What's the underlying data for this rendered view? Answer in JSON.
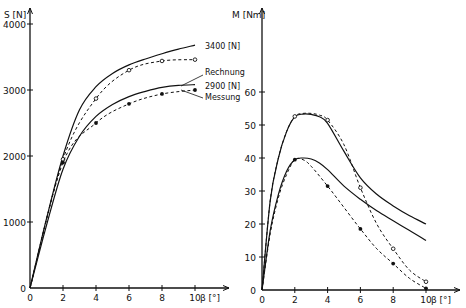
{
  "chart_data": [
    {
      "type": "line",
      "title": "",
      "ylabel": "S [N]",
      "xlabel": "β [°]",
      "xlim": [
        0,
        10
      ],
      "ylim": [
        0,
        4000
      ],
      "xticks": [
        0,
        2,
        4,
        6,
        8,
        10
      ],
      "yticks": [
        0,
        1000,
        2000,
        3000,
        4000
      ],
      "grid": false,
      "annotations": [
        "3400 [N]",
        "Rechnung",
        "2900 [N]",
        "Messung"
      ],
      "series": [
        {
          "name": "Rechnung 3400 [N]",
          "style": "solid",
          "x": [
            0,
            1,
            2,
            3,
            4,
            5,
            6,
            7,
            8,
            9,
            10
          ],
          "y": [
            0,
            1050,
            2000,
            2700,
            3050,
            3250,
            3380,
            3470,
            3550,
            3620,
            3680
          ]
        },
        {
          "name": "Messung 3400 [N]",
          "style": "dashed",
          "marker": "open-circle",
          "x": [
            0,
            2,
            4,
            6,
            8,
            10
          ],
          "y": [
            0,
            1950,
            2870,
            3300,
            3440,
            3460
          ]
        },
        {
          "name": "Rechnung 2900 [N]",
          "style": "solid",
          "x": [
            0,
            1,
            2,
            3,
            4,
            5,
            6,
            7,
            8,
            9,
            10
          ],
          "y": [
            0,
            950,
            1800,
            2300,
            2600,
            2780,
            2900,
            2980,
            3040,
            3070,
            3080
          ]
        },
        {
          "name": "Messung 2900 [N]",
          "style": "dashed",
          "marker": "filled-circle",
          "x": [
            0,
            2,
            4,
            6,
            8,
            10
          ],
          "y": [
            0,
            1900,
            2500,
            2790,
            2940,
            3000
          ]
        }
      ]
    },
    {
      "type": "line",
      "title": "",
      "ylabel": "M [Nm]",
      "xlabel": "β [°]",
      "xlim": [
        0,
        10
      ],
      "ylim": [
        0,
        70
      ],
      "xticks": [
        0,
        2,
        4,
        6,
        8,
        10
      ],
      "yticks": [
        0,
        10,
        20,
        30,
        40,
        50,
        60
      ],
      "grid": false,
      "series": [
        {
          "name": "Rechnung 3400 [N]",
          "style": "solid",
          "x": [
            0,
            0.5,
            1,
            1.5,
            2,
            2.5,
            3,
            3.5,
            4,
            5,
            6,
            7,
            8,
            9,
            10
          ],
          "y": [
            0,
            27,
            40,
            48,
            52.5,
            53.3,
            53.2,
            52.5,
            50.5,
            42,
            34,
            29,
            25.5,
            22.5,
            20
          ]
        },
        {
          "name": "Messung 3400 [N]",
          "style": "dashed",
          "marker": "open-circle",
          "x": [
            0,
            0.5,
            1,
            1.5,
            2,
            2.5,
            3,
            3.5,
            4,
            5,
            6,
            7,
            8,
            9,
            10
          ],
          "y": [
            0,
            27,
            40,
            48,
            52.6,
            53.5,
            53.5,
            53,
            51.5,
            44,
            31,
            20,
            12.5,
            6,
            2.5
          ]
        },
        {
          "name": "Rechnung 2900 [N]",
          "style": "solid",
          "x": [
            0,
            0.5,
            1,
            1.5,
            2,
            2.5,
            3,
            3.5,
            4,
            5,
            6,
            7,
            8,
            9,
            10
          ],
          "y": [
            0,
            18,
            29,
            36,
            39.5,
            40,
            39.7,
            38.5,
            36.5,
            31.5,
            27.5,
            24,
            21,
            18,
            15
          ]
        },
        {
          "name": "Messung 2900 [N]",
          "style": "dashed",
          "marker": "filled-circle",
          "x": [
            0,
            0.5,
            1,
            1.5,
            2,
            2.5,
            3,
            4,
            5,
            6,
            7,
            8,
            9,
            10
          ],
          "y": [
            0,
            17,
            28,
            35,
            39.5,
            39.5,
            37.5,
            31.5,
            25,
            18.5,
            12.5,
            8,
            3.5,
            0.5
          ]
        }
      ]
    }
  ]
}
